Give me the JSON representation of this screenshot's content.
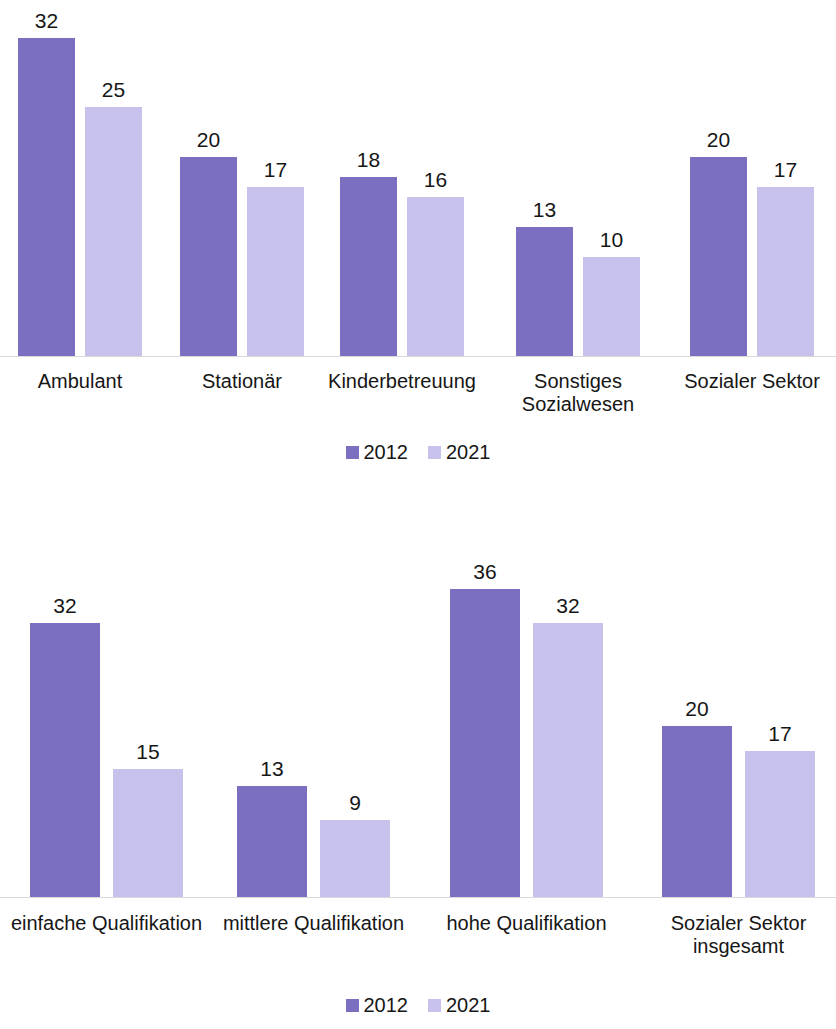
{
  "colors": {
    "series_2012": "#7a6fc0",
    "series_2021": "#c6c2ec",
    "text": "#161616",
    "axis": "#d9d9d9",
    "background": "#ffffff"
  },
  "charts": [
    {
      "id": "chart-top",
      "legend": [
        {
          "label": "2012",
          "color": "#7a6fc0"
        },
        {
          "label": "2021",
          "color": "#c6c2ec"
        }
      ],
      "chart_data": {
        "type": "bar",
        "title": "",
        "subtitle": "",
        "xlabel": "",
        "ylabel": "",
        "ylim": [
          0,
          36
        ],
        "grid": false,
        "legend_position": "bottom-center",
        "categories": [
          "Ambulant",
          "Stationär",
          "Kinderbetreuung",
          "Sonstiges Sozialwesen",
          "Sozialer Sektor"
        ],
        "category_lines": [
          [
            "Ambulant"
          ],
          [
            "Stationär"
          ],
          [
            "Kinderbetreuung"
          ],
          [
            "Sonstiges",
            "Sozialwesen"
          ],
          [
            "Sozialer Sektor"
          ]
        ],
        "series": [
          {
            "name": "2012",
            "color": "#7a6fc0",
            "values": [
              32,
              20,
              18,
              13,
              20
            ]
          },
          {
            "name": "2021",
            "color": "#c6c2ec",
            "values": [
              25,
              17,
              16,
              10,
              17
            ]
          }
        ]
      }
    },
    {
      "id": "chart-bottom",
      "legend": [
        {
          "label": "2012",
          "color": "#7a6fc0"
        },
        {
          "label": "2021",
          "color": "#c6c2ec"
        }
      ],
      "chart_data": {
        "type": "bar",
        "title": "",
        "subtitle": "",
        "xlabel": "",
        "ylabel": "",
        "ylim": [
          0,
          36
        ],
        "grid": false,
        "legend_position": "bottom-center",
        "categories": [
          "einfache Qualifikation",
          "mittlere Qualifikation",
          "hohe Qualifikation",
          "Sozialer Sektor insgesamt"
        ],
        "category_lines": [
          [
            "einfache Qualifikation"
          ],
          [
            "mittlere Qualifikation"
          ],
          [
            "hohe Qualifikation"
          ],
          [
            "Sozialer Sektor",
            "insgesamt"
          ]
        ],
        "series": [
          {
            "name": "2012",
            "color": "#7a6fc0",
            "values": [
              32,
              13,
              36,
              20
            ]
          },
          {
            "name": "2021",
            "color": "#c6c2ec",
            "values": [
              15,
              9,
              32,
              17
            ]
          }
        ]
      }
    }
  ],
  "layout": {
    "top": {
      "baseline_y": 356,
      "px_per_unit": 9.94,
      "bar_width": 57,
      "bar_gap": 10,
      "group_starts": [
        18,
        180,
        340,
        516,
        690
      ],
      "label_y": 370,
      "legend_y": 442
    },
    "bottom": {
      "baseline_y": 397,
      "px_per_unit": 8.56,
      "bar_width": 70,
      "bar_gap": 13,
      "group_starts": [
        30,
        237,
        450,
        662
      ],
      "label_y": 412,
      "legend_y": 495
    }
  }
}
